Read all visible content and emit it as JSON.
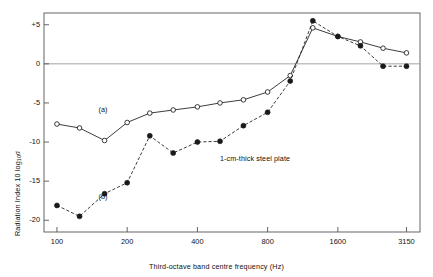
{
  "chart_data": {
    "type": "line",
    "title": "",
    "xlabel": "Third-octave band centre frequency (Hz)",
    "ylabel": "Radiation Index 10 log",
    "ylabel_sub": "10",
    "ylabel_sym": "σ",
    "annotation": "1-cm-thick steel plate",
    "xscale": "log",
    "xlim": [
      88,
      3600
    ],
    "ylim": [
      -21.5,
      6.5
    ],
    "grid": false,
    "legend_position": "inline",
    "xticks": [
      100,
      200,
      400,
      800,
      1600,
      3150
    ],
    "xtick_labels": [
      "100",
      "200",
      "400",
      "800",
      "1600",
      "3150"
    ],
    "yticks": [
      5,
      0,
      -5,
      -10,
      -15,
      -20
    ],
    "ytick_labels": [
      "+5",
      "0",
      "-5",
      "-10",
      "-15",
      "-20"
    ],
    "zero_line": 0,
    "x": [
      100,
      125,
      160,
      200,
      250,
      315,
      400,
      500,
      630,
      800,
      1000,
      1250,
      1600,
      2000,
      2500,
      3150
    ],
    "series": [
      {
        "name": "(a)",
        "marker": "open-circle",
        "linestyle": "solid",
        "label_x": 160,
        "label_y": -5.9,
        "values": [
          -7.7,
          -8.2,
          -9.8,
          -7.5,
          -6.3,
          -5.9,
          -5.5,
          -5.0,
          -4.6,
          -3.6,
          -1.5,
          4.6,
          3.5,
          2.8,
          2.0,
          1.4
        ]
      },
      {
        "name": "(b)",
        "marker": "filled-circle",
        "linestyle": "dashed",
        "label_x": 160,
        "label_y": -17.0,
        "values": [
          -18.1,
          -19.5,
          -16.6,
          -15.2,
          -9.2,
          -11.4,
          -10.0,
          -9.9,
          -7.9,
          -6.2,
          -2.2,
          5.5,
          3.5,
          2.3,
          -0.3,
          -0.3
        ]
      }
    ]
  },
  "colors": {
    "line": "#1a1a1a",
    "frame": "#555555",
    "zero_line": "#999999",
    "background": "#ffffff"
  }
}
